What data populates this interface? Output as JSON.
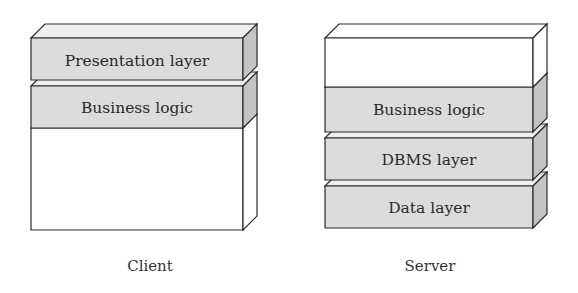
{
  "diagram": {
    "type": "architecture-layers",
    "colors": {
      "stroke": "#2b2b2b",
      "layer_front": "#dcdcdc",
      "layer_top": "#efefef",
      "layer_side": "#c4c4c4",
      "empty_fill": "#ffffff"
    },
    "stacks": [
      {
        "id": "client",
        "caption": "Client",
        "layers": [
          {
            "label": "Presentation layer",
            "filled": true
          },
          {
            "label": "Business logic",
            "filled": true
          },
          {
            "label": "",
            "filled": false
          }
        ]
      },
      {
        "id": "server",
        "caption": "Server",
        "layers": [
          {
            "label": "",
            "filled": false
          },
          {
            "label": "Business logic",
            "filled": true
          },
          {
            "label": "DBMS layer",
            "filled": true
          },
          {
            "label": "Data layer",
            "filled": true
          }
        ]
      }
    ]
  }
}
